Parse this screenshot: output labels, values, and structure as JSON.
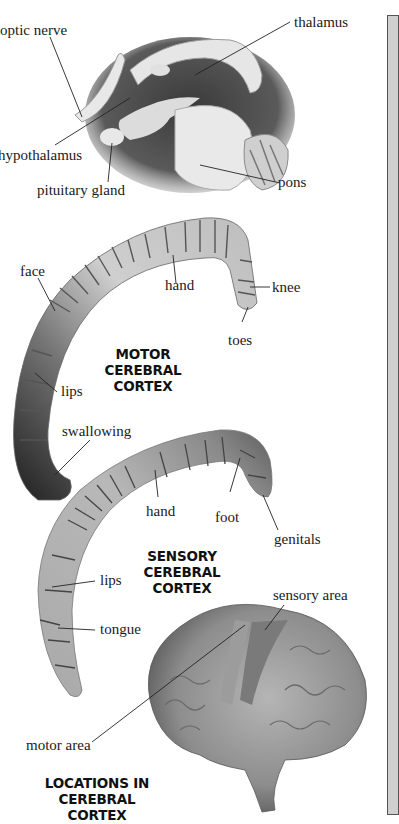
{
  "figure": {
    "brain_section": {
      "labels": {
        "optic_nerve": "optic nerve",
        "thalamus": "thalamus",
        "hypothalamus": "hypothalamus",
        "pituitary_gland": "pituitary gland",
        "pons": "pons"
      }
    },
    "motor_cortex": {
      "title_line1": "MOTOR CEREBRAL",
      "title_line2": "CORTEX",
      "labels": {
        "face": "face",
        "hand": "hand",
        "knee": "knee",
        "toes": "toes",
        "lips": "lips",
        "swallowing": "swallowing"
      }
    },
    "sensory_cortex": {
      "title_line1": "SENSORY CEREBRAL",
      "title_line2": "CORTEX",
      "labels": {
        "hand": "hand",
        "foot": "foot",
        "genitals": "genitals",
        "lips": "lips",
        "tongue": "tongue"
      }
    },
    "brain_locations": {
      "title_line1": "LOCATIONS IN",
      "title_line2": "CEREBRAL CORTEX",
      "labels": {
        "sensory_area": "sensory area",
        "motor_area": "motor area"
      }
    }
  },
  "colors": {
    "background": "#ffffff",
    "panel_fill": "#cfcfcf",
    "panel_border": "#555555",
    "text": "#1a1a1a"
  }
}
